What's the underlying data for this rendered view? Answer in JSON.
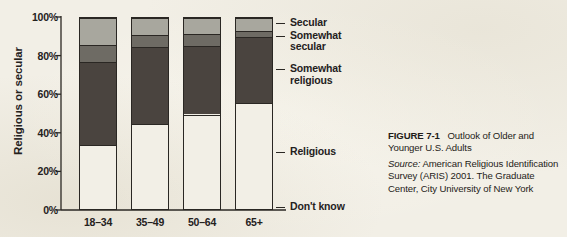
{
  "figure": {
    "caption_number": "FIGURE 7-1",
    "caption_title": "Outlook of Older and Younger U.S. Adults",
    "source_label": "Source:",
    "source_text": "American Religious Identification Survey (ARIS) 2001. The Graduate Center, City University of New York"
  },
  "colors": {
    "background": "#f2efe6",
    "axis": "#2a2723",
    "text": "#24211d",
    "secular": "#c3c1b8",
    "somewhat_secular": "#a8a79e",
    "somewhat_religious": "#6e6b64",
    "religious": "#4a443f",
    "dont_know": "#f2efe6"
  },
  "chart_data": {
    "type": "bar",
    "subtype": "stacked-percent",
    "title": "Outlook of Older and Younger U.S. Adults",
    "xlabel": "",
    "ylabel": "Religious or secular",
    "ylim": [
      0,
      100
    ],
    "ytick_labels": [
      "100%",
      "80%",
      "60%",
      "40%",
      "20%",
      "0%"
    ],
    "ytick_values": [
      100,
      80,
      60,
      40,
      20,
      0
    ],
    "grid": false,
    "legend_position": "right-callouts",
    "categories": [
      "18–34",
      "35–49",
      "50–64",
      "65+"
    ],
    "series": [
      {
        "name": "Don't know",
        "color": "#f2efe6",
        "values": [
          3,
          3,
          3,
          4
        ]
      },
      {
        "name": "Religious",
        "color": "#4a443f",
        "values": [
          31,
          42,
          47,
          52
        ]
      },
      {
        "name": "Somewhat religious",
        "color": "#6e6b64",
        "values": [
          43,
          40,
          35.5,
          34
        ]
      },
      {
        "name": "Somewhat secular",
        "color": "#a8a79e",
        "values": [
          9,
          6,
          6,
          3.5
        ]
      },
      {
        "name": "Secular",
        "color": "#c3c1b8",
        "values": [
          14,
          9,
          8.5,
          6.5
        ]
      }
    ],
    "cumulative_tops": {
      "18–34": {
        "dont_know": 3,
        "religious": 34,
        "somewhat_religious": 77,
        "somewhat_secular": 86,
        "secular": 100
      },
      "35–49": {
        "dont_know": 3,
        "religious": 45,
        "somewhat_religious": 85,
        "somewhat_secular": 91,
        "secular": 100
      },
      "50–64": {
        "dont_know": 3,
        "religious": 50,
        "somewhat_religious": 85.5,
        "somewhat_secular": 91.5,
        "secular": 100
      },
      "65+": {
        "dont_know": 4,
        "religious": 56,
        "somewhat_religious": 90,
        "somewhat_secular": 93.5,
        "secular": 100
      }
    }
  },
  "callouts": [
    {
      "label": "Secular"
    },
    {
      "label": "Somewhat\nsecular"
    },
    {
      "label": "Somewhat\nreligious"
    },
    {
      "label": "Religious"
    },
    {
      "label": "Don't know"
    }
  ]
}
